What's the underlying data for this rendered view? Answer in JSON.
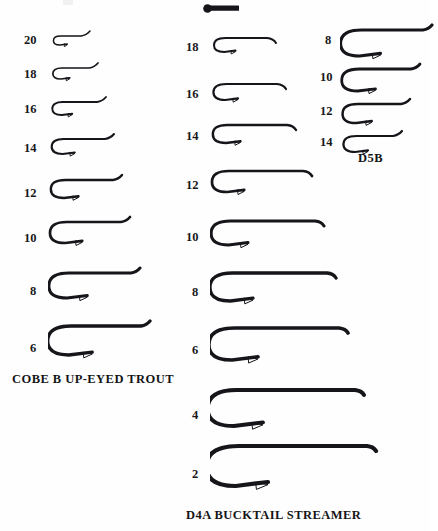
{
  "page": {
    "background_color": "#fefefe",
    "ink_color": "#15151a",
    "width": 429,
    "height": 531
  },
  "columns": [
    {
      "id": "left",
      "caption": "COBE B UP-EYED TROUT",
      "caption_x": 12,
      "caption_y": 372,
      "eye_style": "up-turned",
      "hooks": [
        {
          "size": "20",
          "label_x": 24,
          "label_y": 34,
          "hook_x": 48,
          "hook_y": 28,
          "shank": 28,
          "gape": 9,
          "weight": 1.5
        },
        {
          "size": "18",
          "label_x": 24,
          "label_y": 68,
          "hook_x": 48,
          "hook_y": 60,
          "shank": 36,
          "gape": 11,
          "weight": 1.7
        },
        {
          "size": "16",
          "label_x": 24,
          "label_y": 103,
          "hook_x": 48,
          "hook_y": 94,
          "shank": 44,
          "gape": 13,
          "weight": 1.9
        },
        {
          "size": "14",
          "label_x": 24,
          "label_y": 142,
          "hook_x": 48,
          "hook_y": 131,
          "shank": 52,
          "gape": 15,
          "weight": 2.1
        },
        {
          "size": "12",
          "label_x": 24,
          "label_y": 187,
          "hook_x": 48,
          "hook_y": 172,
          "shank": 60,
          "gape": 18,
          "weight": 2.4
        },
        {
          "size": "10",
          "label_x": 24,
          "label_y": 232,
          "hook_x": 48,
          "hook_y": 214,
          "shank": 68,
          "gape": 21,
          "weight": 2.7
        },
        {
          "size": "8",
          "label_x": 30,
          "label_y": 285,
          "hook_x": 48,
          "hook_y": 265,
          "shank": 78,
          "gape": 25,
          "weight": 3.0
        },
        {
          "size": "6",
          "label_x": 30,
          "label_y": 342,
          "hook_x": 48,
          "hook_y": 318,
          "shank": 88,
          "gape": 29,
          "weight": 3.3
        }
      ]
    },
    {
      "id": "center",
      "caption": "D4A BUCKTAIL STREAMER",
      "caption_x": 186,
      "caption_y": 508,
      "eye_style": "down-turned",
      "hooks": [
        {
          "size": "18",
          "label_x": 186,
          "label_y": 41,
          "hook_x": 210,
          "hook_y": 30,
          "shank": 52,
          "gape": 14,
          "weight": 2.0
        },
        {
          "size": "16",
          "label_x": 186,
          "label_y": 88,
          "hook_x": 210,
          "hook_y": 76,
          "shank": 62,
          "gape": 16,
          "weight": 2.2
        },
        {
          "size": "14",
          "label_x": 186,
          "label_y": 130,
          "hook_x": 210,
          "hook_y": 117,
          "shank": 72,
          "gape": 18,
          "weight": 2.4
        },
        {
          "size": "12",
          "label_x": 186,
          "label_y": 179,
          "hook_x": 210,
          "hook_y": 163,
          "shank": 88,
          "gape": 21,
          "weight": 2.7
        },
        {
          "size": "10",
          "label_x": 186,
          "label_y": 231,
          "hook_x": 210,
          "hook_y": 213,
          "shank": 100,
          "gape": 24,
          "weight": 3.0
        },
        {
          "size": "8",
          "label_x": 192,
          "label_y": 286,
          "hook_x": 210,
          "hook_y": 265,
          "shank": 112,
          "gape": 28,
          "weight": 3.3
        },
        {
          "size": "6",
          "label_x": 192,
          "label_y": 344,
          "hook_x": 210,
          "hook_y": 320,
          "shank": 124,
          "gape": 32,
          "weight": 3.6
        },
        {
          "size": "4",
          "label_x": 192,
          "label_y": 409,
          "hook_x": 210,
          "hook_y": 382,
          "shank": 140,
          "gape": 36,
          "weight": 3.9
        },
        {
          "size": "2",
          "label_x": 192,
          "label_y": 468,
          "hook_x": 210,
          "hook_y": 438,
          "shank": 152,
          "gape": 40,
          "weight": 4.2
        }
      ]
    },
    {
      "id": "right",
      "caption": "D5B",
      "caption_x": 358,
      "caption_y": 151,
      "eye_style": "up-turned",
      "hooks": [
        {
          "size": "8",
          "label_x": 325,
          "label_y": 34,
          "hook_x": 340,
          "hook_y": 22,
          "shank": 78,
          "gape": 26,
          "weight": 3.1
        },
        {
          "size": "10",
          "label_x": 320,
          "label_y": 71,
          "hook_x": 340,
          "hook_y": 61,
          "shank": 66,
          "gape": 22,
          "weight": 2.8
        },
        {
          "size": "12",
          "label_x": 320,
          "label_y": 105,
          "hook_x": 340,
          "hook_y": 96,
          "shank": 56,
          "gape": 19,
          "weight": 2.5
        },
        {
          "size": "14",
          "label_x": 320,
          "label_y": 136,
          "hook_x": 340,
          "hook_y": 128,
          "shank": 48,
          "gape": 16,
          "weight": 2.2
        }
      ]
    }
  ],
  "top_fragment": {
    "name": "cut-off-hook-shank",
    "x": 203,
    "y": 4,
    "width": 36,
    "height": 9,
    "description": "partial hook shank and eye cropped at top edge"
  },
  "faint_mark": {
    "x": 63,
    "y": 0,
    "width": 10,
    "height": 5
  }
}
